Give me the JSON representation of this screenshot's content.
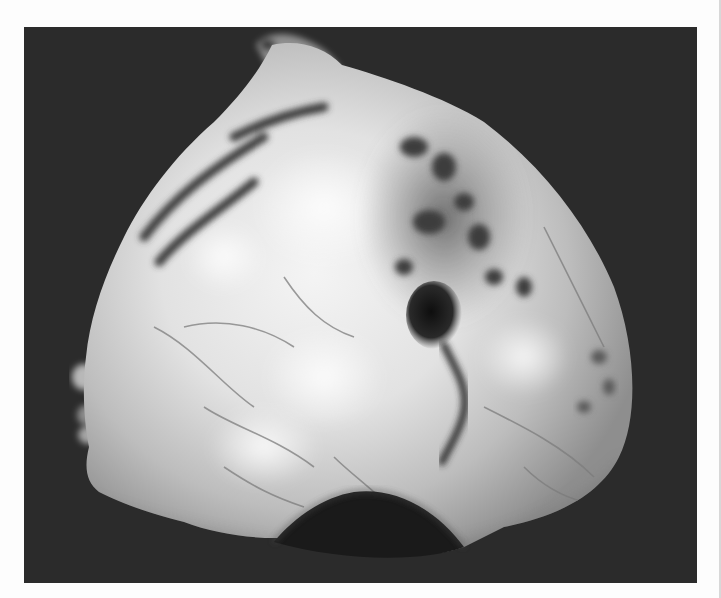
{
  "figure": {
    "type": "gross-pathology-photograph",
    "background_color": "#2b2b2b",
    "page_color": "#ffffff",
    "specimen_tones": {
      "highlight": "#f2f2f2",
      "mid": "#b9b9b9",
      "shadow": "#4a4a4a",
      "dark_lesion": "#151515"
    },
    "caption_fragment": ""
  }
}
